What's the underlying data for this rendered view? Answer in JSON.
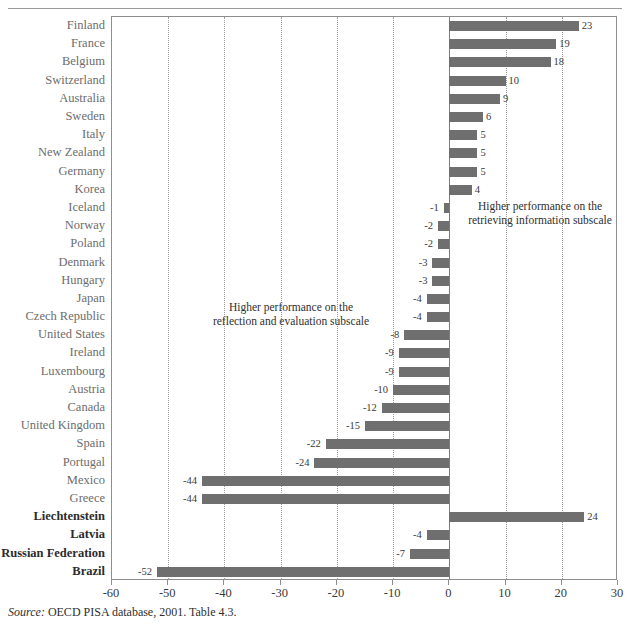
{
  "chart_data": {
    "type": "bar",
    "orientation": "horizontal",
    "title": "",
    "xlabel": "",
    "ylabel": "",
    "xlim": [
      -60,
      30
    ],
    "xticks": [
      -60,
      -50,
      -40,
      -30,
      -20,
      -10,
      0,
      10,
      20,
      30
    ],
    "xtick_labels": [
      "-60",
      "-50",
      "-40",
      "-30",
      "-20",
      "-10",
      "0",
      "10",
      "20",
      "30"
    ],
    "grid": true,
    "grid_axis": "x",
    "legend": "none",
    "bar_color": "#706F6F",
    "categories": [
      "Finland",
      "France",
      "Belgium",
      "Switzerland",
      "Australia",
      "Sweden",
      "Italy",
      "New Zealand",
      "Germany",
      "Korea",
      "Iceland",
      "Norway",
      "Poland",
      "Denmark",
      "Hungary",
      "Japan",
      "Czech Republic",
      "United States",
      "Ireland",
      "Luxembourg",
      "Austria",
      "Canada",
      "United Kingdom",
      "Spain",
      "Portugal",
      "Mexico",
      "Greece",
      "Liechtenstein",
      "Latvia",
      "Russian Federation",
      "Brazil"
    ],
    "values": [
      23,
      19,
      18,
      10,
      9,
      6,
      5,
      5,
      5,
      4,
      -1,
      -2,
      -2,
      -3,
      -3,
      -4,
      -4,
      -8,
      -9,
      -9,
      -10,
      -12,
      -15,
      -22,
      -24,
      -44,
      -44,
      24,
      -4,
      -7,
      -52
    ],
    "value_labels": [
      "23",
      "19",
      "18",
      "10",
      "9",
      "6",
      "5",
      "5",
      "5",
      "4",
      "-1",
      "-2",
      "-2",
      "-3",
      "-3",
      "-4",
      "-4",
      "-8",
      "-9",
      "-9",
      "-10",
      "-12",
      "-15",
      "-22",
      "-24",
      "-44",
      "-44",
      "24",
      "-4",
      "-7",
      "-52"
    ],
    "emphasized_categories": [
      "Liechtenstein",
      "Latvia",
      "Russian Federation",
      "Brazil"
    ],
    "annotations": [
      {
        "name": "right-annotation",
        "text": "Higher performance on the\nretrieving information subscale"
      },
      {
        "name": "left-annotation",
        "text": "Higher performance on the\nreflection and evaluation subscale"
      }
    ]
  },
  "source_note": {
    "label": "Source:",
    "text": "OECD PISA database, 2001. Table 4.3."
  }
}
